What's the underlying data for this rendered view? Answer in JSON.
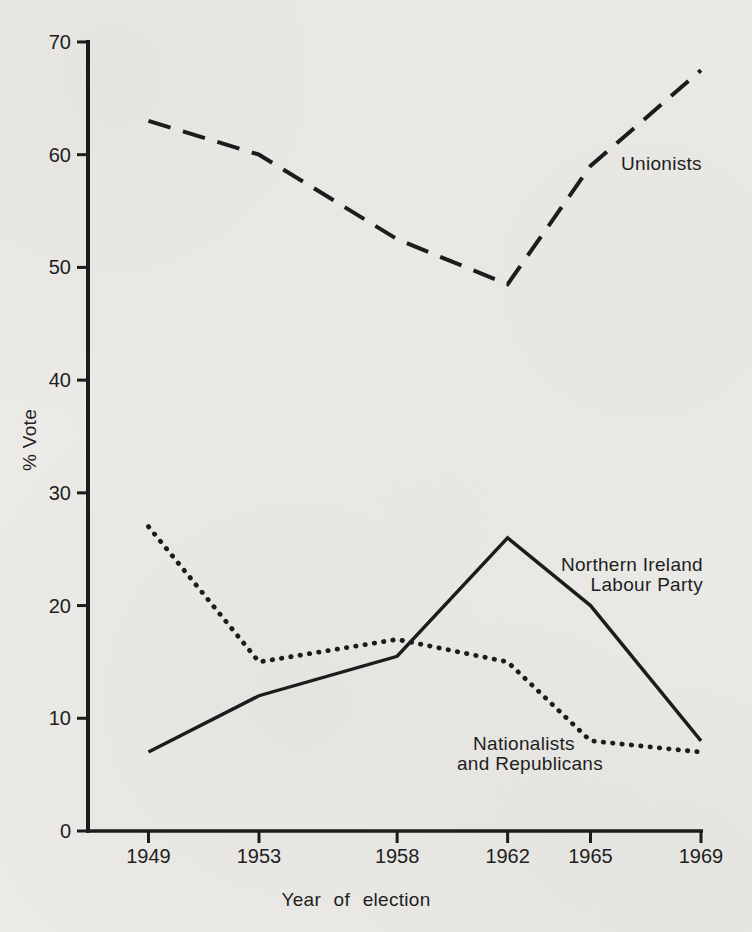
{
  "figure": {
    "background": "#ebeae7",
    "ink": "#1c1c1c",
    "text_color": "#1e1e1e"
  },
  "chart_data": {
    "type": "line",
    "title": "",
    "xlabel": "Year of election",
    "ylabel": "% Vote",
    "x": [
      1949,
      1953,
      1958,
      1962,
      1965,
      1969
    ],
    "x_tick_labels": [
      "1949",
      "1953",
      "1958",
      "1962",
      "1965",
      "1969"
    ],
    "y_ticks": [
      0,
      10,
      20,
      30,
      40,
      50,
      60,
      70
    ],
    "ylim": [
      0,
      70
    ],
    "grid": false,
    "legend_position": "inline-annotations",
    "series": [
      {
        "name": "Unionists",
        "line_style": "dashed",
        "values": [
          63,
          60,
          52.5,
          48.5,
          59,
          67.5
        ]
      },
      {
        "name": "Northern Ireland Labour Party",
        "line_style": "solid",
        "values": [
          7,
          12,
          15.5,
          26,
          20,
          8
        ]
      },
      {
        "name": "Nationalists and Republicans",
        "line_style": "dotted",
        "values": [
          27,
          15,
          17,
          15,
          8,
          7
        ]
      }
    ],
    "annotations": {
      "unionists": "Unionists",
      "nilp_line1": "Northern Ireland",
      "nilp_line2": "Labour Party",
      "nationalists_line1": "Nationalists",
      "nationalists_line2": "and Republicans"
    }
  }
}
